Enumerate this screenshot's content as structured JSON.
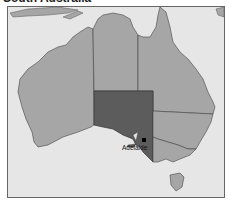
{
  "title": "South Australia",
  "map": {
    "highlighted_region": "South Australia",
    "city_label": "Adelaide",
    "colors": {
      "sea": "#e6e6e6",
      "land": "#a6a6a6",
      "highlight": "#5c5c5c",
      "border": "#444444",
      "city_marker": "#000000"
    }
  }
}
